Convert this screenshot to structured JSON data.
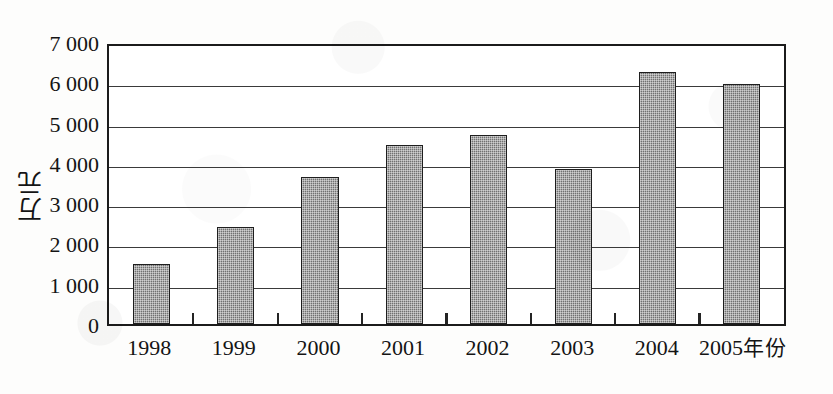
{
  "chart_data": {
    "type": "bar",
    "title": "",
    "subtitle": "",
    "xlabel": "年份",
    "ylabel": "万元",
    "categories": [
      "1998",
      "1999",
      "2000",
      "2001",
      "2002",
      "2003",
      "2004",
      "2005"
    ],
    "values": [
      1500,
      2450,
      3700,
      4500,
      4750,
      3900,
      6350,
      6050
    ],
    "series": [
      {
        "name": "",
        "values": [
          1500,
          2450,
          3700,
          4500,
          4750,
          3900,
          6350,
          6050
        ]
      }
    ],
    "ylim": [
      0,
      7000
    ],
    "ytick_step": 1000,
    "ytick_values": [
      0,
      1000,
      2000,
      3000,
      4000,
      5000,
      6000,
      7000
    ],
    "ytick_labels": [
      "0",
      "1 000",
      "2 000",
      "3 000",
      "4 000",
      "5 000",
      "6 000",
      "7 000"
    ],
    "grid": true,
    "grid_axis": "y",
    "legend": false,
    "legend_position": "none",
    "annotations": [],
    "bar_color": "#717171",
    "bar_edge_color": "#1e1e1e",
    "grid_color": "#3a3a3a",
    "frame_color": "#1b1b1b",
    "background_color": "#ffffff"
  },
  "axes": {
    "y_title": "万元",
    "x_last_label_year": "2005",
    "x_unit_suffix": "年份"
  }
}
